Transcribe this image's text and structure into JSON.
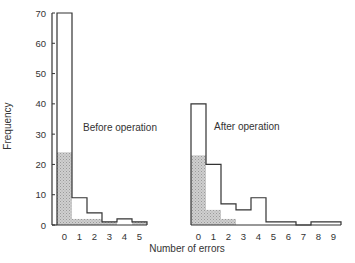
{
  "chart_data": {
    "type": "bar",
    "title": "",
    "xlabel": "Number of errors",
    "ylabel": "Frequency",
    "ylim": [
      0,
      70
    ],
    "yticks": [
      0,
      10,
      20,
      30,
      40,
      50,
      60,
      70
    ],
    "grid": false,
    "legend": "none",
    "panels": [
      {
        "name": "Before operation",
        "categories": [
          "0",
          "1",
          "2",
          "3",
          "4",
          "5"
        ],
        "series": [
          {
            "name": "total",
            "values": [
              70,
              9,
              4,
              1,
              2,
              1
            ]
          },
          {
            "name": "shaded",
            "values": [
              24,
              2,
              2,
              1,
              0,
              1
            ]
          }
        ]
      },
      {
        "name": "After operation",
        "categories": [
          "0",
          "1",
          "2",
          "3",
          "4",
          "5",
          "6",
          "7",
          "8",
          "9"
        ],
        "series": [
          {
            "name": "total",
            "values": [
              40,
              20,
              7,
              5,
              9,
              1,
              1,
              0,
              1,
              1
            ]
          },
          {
            "name": "shaded",
            "values": [
              23,
              5,
              2,
              0,
              0,
              0,
              0,
              0,
              0,
              0
            ]
          }
        ]
      }
    ]
  },
  "labels": {
    "ylabel": "Frequency",
    "xlabel": "Number of errors",
    "before": "Before operation",
    "after": "After operation"
  },
  "colors": {
    "outline": "#333333",
    "shade": "#bdbdbd"
  }
}
